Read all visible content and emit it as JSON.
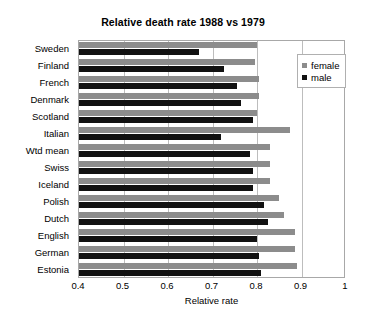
{
  "chart_data": {
    "type": "bar",
    "orientation": "horizontal",
    "title": "Relative death rate 1988 vs 1979",
    "xlabel": "Relative rate",
    "ylabel": "",
    "xlim": [
      0.4,
      1.0
    ],
    "xticks": [
      "0.4",
      "0.5",
      "0.6",
      "0.7",
      "0.8",
      "0.9",
      "1"
    ],
    "xtick_values": [
      0.4,
      0.5,
      0.6,
      0.7,
      0.8,
      0.9,
      1.0
    ],
    "grid": true,
    "legend_position": "top-right",
    "categories": [
      "Sweden",
      "Finland",
      "French",
      "Denmark",
      "Scotland",
      "Italian",
      "Wtd mean",
      "Swiss",
      "Iceland",
      "Polish",
      "Dutch",
      "English",
      "German",
      "Estonia"
    ],
    "series": [
      {
        "name": "female",
        "color": "#8c8c8c",
        "values": [
          0.8,
          0.795,
          0.805,
          0.805,
          0.8,
          0.875,
          0.83,
          0.83,
          0.83,
          0.85,
          0.86,
          0.885,
          0.885,
          0.89
        ]
      },
      {
        "name": "male",
        "color": "#111111",
        "values": [
          0.67,
          0.725,
          0.755,
          0.765,
          0.79,
          0.72,
          0.785,
          0.79,
          0.79,
          0.815,
          0.825,
          0.8,
          0.805,
          0.81
        ]
      }
    ]
  },
  "legend": {
    "items": [
      {
        "label": "female",
        "color": "#8c8c8c"
      },
      {
        "label": "male",
        "color": "#111111"
      }
    ]
  }
}
